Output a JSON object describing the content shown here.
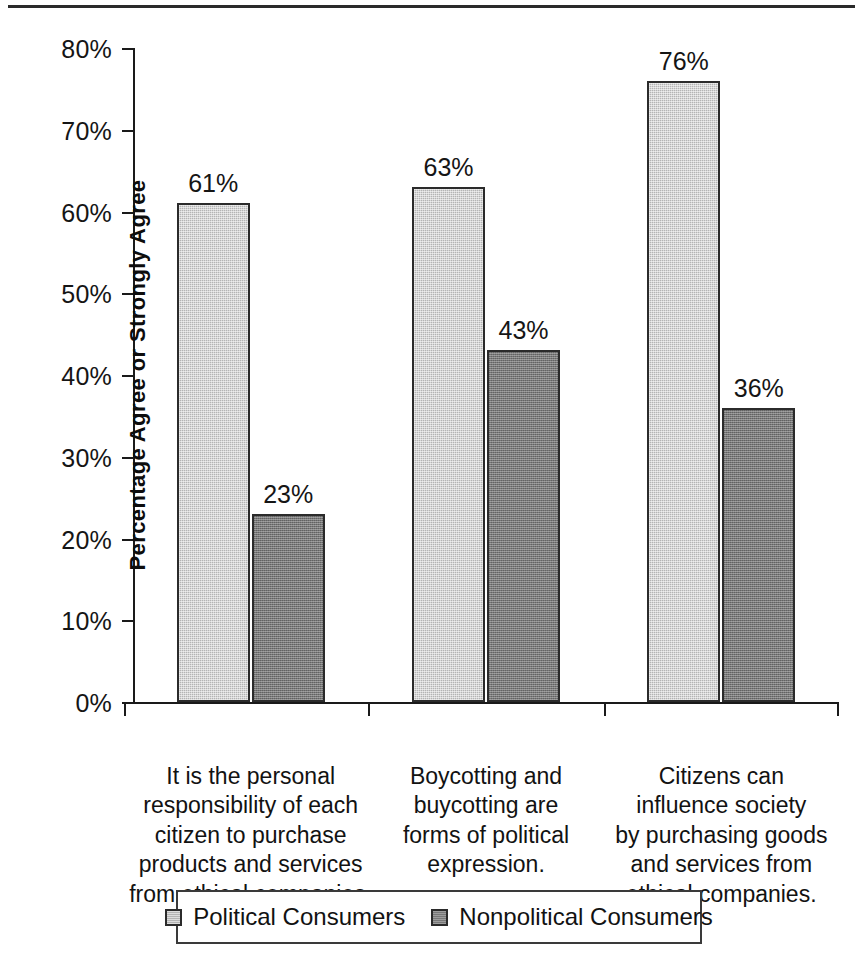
{
  "chart_data": {
    "type": "bar",
    "title": "",
    "subtitle": "",
    "xlabel": "",
    "ylabel": "Percentage Agree or Strongly Agree",
    "ylim": [
      0,
      80
    ],
    "ytick_labels": [
      "0%",
      "10%",
      "20%",
      "30%",
      "40%",
      "50%",
      "60%",
      "70%",
      "80%"
    ],
    "ytick_values": [
      0,
      10,
      20,
      30,
      40,
      50,
      60,
      70,
      80
    ],
    "grid": false,
    "legend_position": "bottom",
    "categories": [
      "It is the personal responsibility of each citizen to purchase products and services from ethical companies.",
      "Boycotting and buycotting are forms of political expression.",
      "Citizens can influence society by purchasing goods and services from ethical companies."
    ],
    "category_lines": [
      [
        "It is the personal",
        "responsibility of each",
        "citizen to purchase",
        "products and services",
        "from ethical companies."
      ],
      [
        "Boycotting and",
        "buycotting are",
        "forms of political",
        "expression."
      ],
      [
        "Citizens can",
        "influence society",
        "by purchasing goods",
        "and services from",
        "ethical companies."
      ]
    ],
    "series": [
      {
        "name": "Political Consumers",
        "color": "#b4b4b4",
        "values": [
          61,
          63,
          76
        ],
        "labels": [
          "61%",
          "63%",
          "76%"
        ]
      },
      {
        "name": "Nonpolitical Consumers",
        "color": "#787878",
        "values": [
          23,
          43,
          36
        ],
        "labels": [
          "23%",
          "43%",
          "36%"
        ]
      }
    ]
  },
  "legend": {
    "entries": [
      {
        "label": "Political Consumers"
      },
      {
        "label": "Nonpolitical Consumers"
      }
    ]
  }
}
